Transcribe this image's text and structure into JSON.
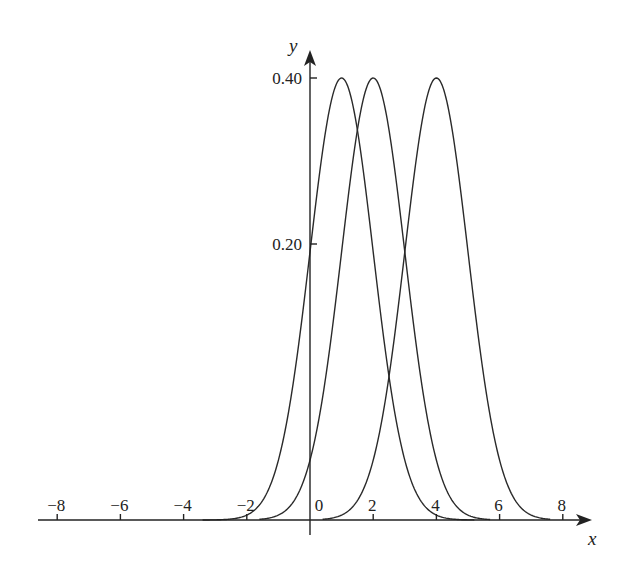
{
  "chart_data": {
    "type": "line",
    "title": "",
    "xlabel": "x",
    "ylabel": "y",
    "xlim": [
      -8.5,
      8.8
    ],
    "ylim": [
      0,
      0.42
    ],
    "grid": false,
    "legend": null,
    "x_ticks": [
      -8,
      -6,
      -4,
      -2,
      0,
      2,
      4,
      6,
      8
    ],
    "x_tick_labels": [
      "−8",
      "−6",
      "−4",
      "−2",
      "0",
      "2",
      "4",
      "6",
      "8"
    ],
    "y_ticks": [
      0.2,
      0.4
    ],
    "y_tick_labels": [
      "0.20",
      "0.40"
    ],
    "series": [
      {
        "name": "N(1, 1)",
        "mean": 1,
        "sd": 1,
        "peak": 0.4,
        "x_range": [
          -3.4,
          5.2
        ]
      },
      {
        "name": "N(2, 1)",
        "mean": 2,
        "sd": 1,
        "peak": 0.4,
        "x_range": [
          -1.6,
          5.7
        ]
      },
      {
        "name": "N(4, 1)",
        "mean": 4,
        "sd": 1,
        "peak": 0.4,
        "x_range": [
          0.4,
          7.6
        ]
      }
    ],
    "annotations": []
  },
  "axes": {
    "x_label": "x",
    "y_label": "y"
  }
}
